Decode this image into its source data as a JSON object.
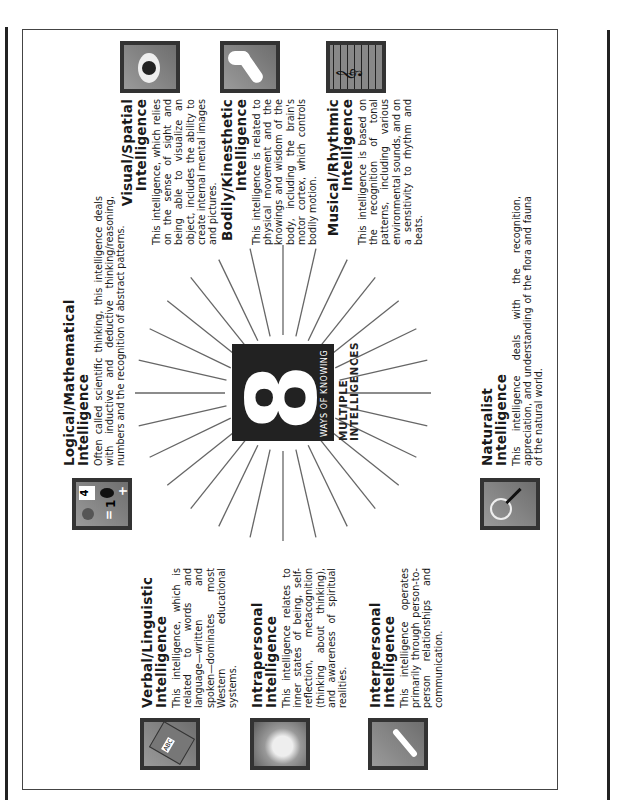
{
  "center": {
    "numeral": "8",
    "subtitle": "WAYS OF KNOWING",
    "heading_line1": "MULTIPLE",
    "heading_line2": "INTELLIGENCES"
  },
  "intelligences": [
    {
      "id": "logical-mathematical",
      "title_line1": "Logical/Mathematical",
      "title_line2": "Intelligence",
      "icon": "math-symbols-icon",
      "description": "Often called scientific thinking, this intelligence deals with inductive and deductive thinking/reasoning, numbers and the recognition of abstract patterns."
    },
    {
      "id": "visual-spatial",
      "title_line1": "Visual/Spatial",
      "title_line2": "Intelligence",
      "icon": "eye-icon",
      "description": "This intelligence, which relies on the sense of sight and being able to visualize an object, includes the ability to create internal mental images and pictures."
    },
    {
      "id": "bodily-kinesthetic",
      "title_line1": "Bodily/Kinesthetic",
      "title_line2": "Intelligence",
      "icon": "flexed-arm-icon",
      "description": "This intelligence is related to physical movement and the knowings and wisdom of the body, including the brain's motor cortex, which controls bodily motion."
    },
    {
      "id": "musical-rhythmic",
      "title_line1": "Musical/Rhythmic",
      "title_line2": "Intelligence",
      "icon": "music-staff-icon",
      "description": "This intelligence is based on the recognition of tonal patterns, including various environmental sounds, and on a sensitivity to rhythm and beats."
    },
    {
      "id": "naturalist",
      "title_line1": "Naturalist",
      "title_line2": "Intelligence",
      "icon": "magnifier-leaf-icon",
      "description": "This intelligence deals with the recognition, appreciation, and understanding of the flora and fauna of the natural world."
    },
    {
      "id": "interpersonal",
      "title_line1": "Interpersonal",
      "title_line2": "Intelligence",
      "icon": "handshake-icon",
      "description": "This intelligence operates primarily through person-to-person relationships and communication."
    },
    {
      "id": "intrapersonal",
      "title_line1": "Intrapersonal",
      "title_line2": "Intelligence",
      "icon": "glowing-head-icon",
      "description": "This intelligence relates to inner states of being, self-reflection, metacognition (thinking about thinking), and awareness of spiritual realities."
    },
    {
      "id": "verbal-linguistic",
      "title_line1": "Verbal/Linguistic",
      "title_line2": "Intelligence",
      "icon": "abc-book-icon",
      "description": "This intelligence, which is related to words and language—written and spoken—dominates most Western educational systems."
    }
  ],
  "colors": {
    "ink": "#1a1a1a",
    "center_box": "#222222",
    "ray": "#666666",
    "frame": "#444444"
  }
}
